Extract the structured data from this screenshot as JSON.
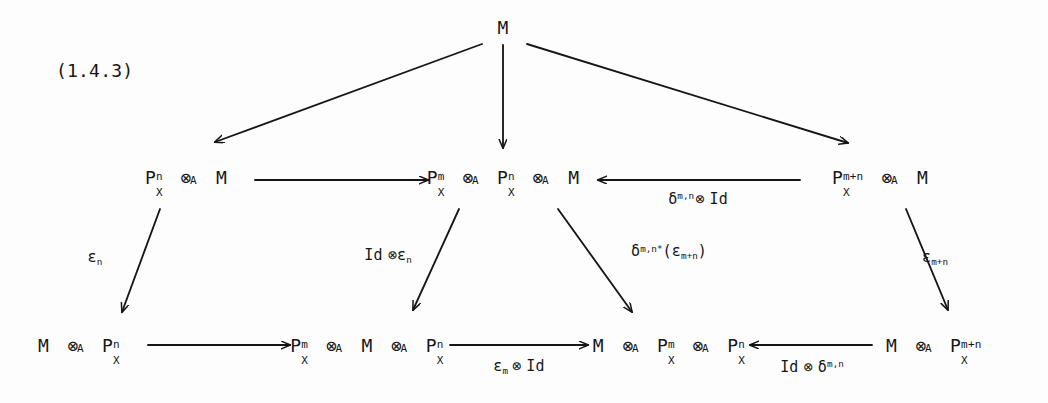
{
  "document": {
    "equation_number": "(1.4.3)",
    "kind": "commutative-diagram",
    "background_color": "#fdfdfd",
    "ink_color": "#161616"
  },
  "nodes": {
    "top_m": {
      "label": "M",
      "x": 503,
      "y": 28
    },
    "mid_left": {
      "label": "P_X^n ⊗_A M",
      "x": 186,
      "y": 178
    },
    "mid_center": {
      "label": "P_X^m ⊗_A P_X^n ⊗_A M",
      "x": 503,
      "y": 178
    },
    "mid_right": {
      "label": "P_X^{m+n} ⊗_A M",
      "x": 880,
      "y": 178
    },
    "bot_left": {
      "label": "M ⊗_A P_X^n",
      "x": 82,
      "y": 346
    },
    "bot_center_l": {
      "label": "P_X^m ⊗_A M ⊗_A P_X^n",
      "x": 370,
      "y": 346
    },
    "bot_center_r": {
      "label": "M ⊗_A P_X^m ⊗_A P_X^n",
      "x": 672,
      "y": 346
    },
    "bot_right": {
      "label": "M ⊗_A P_X^{m+n}",
      "x": 937,
      "y": 346
    }
  },
  "edges": [
    {
      "id": "m-to-midleft",
      "from": "top_m",
      "to": "mid_left",
      "label": "",
      "style": "diagonal"
    },
    {
      "id": "m-to-midcenter",
      "from": "top_m",
      "to": "mid_center",
      "label": "",
      "style": "vertical"
    },
    {
      "id": "m-to-midright",
      "from": "top_m",
      "to": "mid_right",
      "label": "",
      "style": "diagonal"
    },
    {
      "id": "midleft-to-midcenter",
      "from": "mid_left",
      "to": "mid_center",
      "label": "",
      "style": "horizontal"
    },
    {
      "id": "midright-to-midcenter",
      "from": "mid_right",
      "to": "mid_center",
      "label": "δ^{m,n} ⊗ Id",
      "style": "horizontal-left"
    },
    {
      "id": "midleft-to-botleft",
      "from": "mid_left",
      "to": "bot_left",
      "label": "ε_n",
      "style": "diagonal"
    },
    {
      "id": "midcenter-to-botcl",
      "from": "mid_center",
      "to": "bot_center_l",
      "label": "Id ⊗ ε_n",
      "style": "diagonal"
    },
    {
      "id": "midcenter-to-botcr",
      "from": "mid_center",
      "to": "bot_center_r",
      "label": "δ^{m,n*}(ε_{m+n})",
      "style": "diagonal"
    },
    {
      "id": "midright-to-botright",
      "from": "mid_right",
      "to": "bot_right",
      "label": "ε_{m+n}",
      "style": "diagonal"
    },
    {
      "id": "botleft-to-botcl",
      "from": "bot_left",
      "to": "bot_center_l",
      "label": "",
      "style": "horizontal"
    },
    {
      "id": "botcl-to-botcr",
      "from": "bot_center_l",
      "to": "bot_center_r",
      "label": "ε_m ⊗ Id",
      "style": "horizontal"
    },
    {
      "id": "botright-to-botcr",
      "from": "bot_right",
      "to": "bot_center_r",
      "label": "Id ⊗ δ^{m,n}",
      "style": "horizontal-left"
    }
  ],
  "edge_labels": {
    "delta_mn_tensor_id": {
      "text_a": "δ",
      "sup": "m,n",
      "tensor": "⊗",
      "text_b": "Id"
    },
    "epsilon_n": {
      "base": "ε",
      "sub": "n"
    },
    "id_tensor_epsilon_n": {
      "id": "Id",
      "tensor": "⊗",
      "base": "ε",
      "sub": "n"
    },
    "delta_pullback_eps": {
      "base": "δ",
      "sup": "m,n*",
      "open": "(",
      "eps": "ε",
      "eps_sub": "m+n",
      "close": ")"
    },
    "epsilon_mn": {
      "base": "ε",
      "sub": "m+n"
    },
    "epsilon_m_tensor_id": {
      "base": "ε",
      "sub": "m",
      "tensor": "⊗",
      "id": "Id"
    },
    "id_tensor_delta_mn": {
      "id": "Id",
      "tensor": "⊗",
      "base": "δ",
      "sup": "m,n"
    }
  },
  "symbols": {
    "P": "P",
    "X": "X",
    "A": "A",
    "M": "M",
    "tensor": "⊗",
    "n": "n",
    "m": "m",
    "m_plus_n": "m+n"
  }
}
